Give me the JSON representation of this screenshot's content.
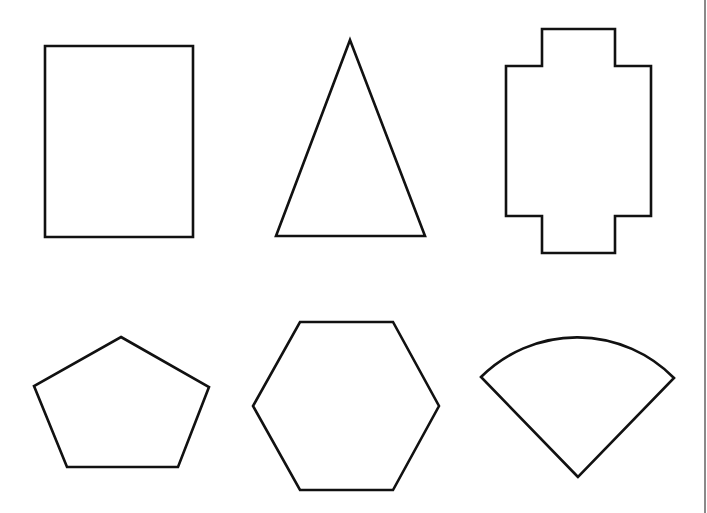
{
  "page": {
    "width": 707,
    "height": 513,
    "background": "#ffffff"
  },
  "style": {
    "stroke_color": "#111111",
    "fill_color": "#ffffff",
    "right_edge_line_color": "#8a8a8a"
  },
  "shapes": [
    {
      "id": "rectangle",
      "label": "Rectangle",
      "kind": "polygon",
      "points": "45,46 193,46 193,237 45,237"
    },
    {
      "id": "triangle",
      "label": "Isosceles triangle",
      "kind": "polygon",
      "points": "350,40 425,236 276,236"
    },
    {
      "id": "cross",
      "label": "Cross-shaped polygon",
      "kind": "polygon",
      "points": "542,29 615,29 615,66 651,66 651,216 615,216 615,253 542,253 542,216 506,216 506,66 542,66"
    },
    {
      "id": "pentagon",
      "label": "Pentagon",
      "kind": "polygon",
      "points": "121,337 209,387 178,467 67,467 34,386"
    },
    {
      "id": "hexagon",
      "label": "Hexagon",
      "kind": "polygon",
      "points": "300,322 393,322 439,406 393,490 300,490 253,406"
    },
    {
      "id": "sector",
      "label": "Circular sector",
      "kind": "path",
      "d": "M 578,477 L 481,377 A 136 136 0 0 1 674,378 Z"
    }
  ],
  "right_edge_line": {
    "x1": 705,
    "y1": 0,
    "x2": 705,
    "y2": 513
  }
}
